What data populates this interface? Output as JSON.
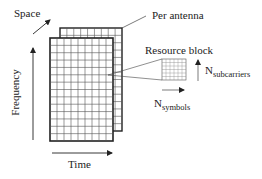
{
  "diagram": {
    "labels": {
      "space": "Space",
      "per_antenna": "Per antenna",
      "resource_block": "Resource block",
      "frequency": "Frequency",
      "time": "Time",
      "n_subcarriers_main": "N",
      "n_subcarriers_sub": "subcarriers",
      "n_symbols_main": "N",
      "n_symbols_sub": "symbols"
    },
    "grids": {
      "front": {
        "cols": 9,
        "rows": 14
      },
      "back": {
        "cols": 9,
        "rows": 14
      }
    },
    "colors": {
      "line": "#222222",
      "grid": "#555555",
      "background": "#ffffff"
    }
  }
}
